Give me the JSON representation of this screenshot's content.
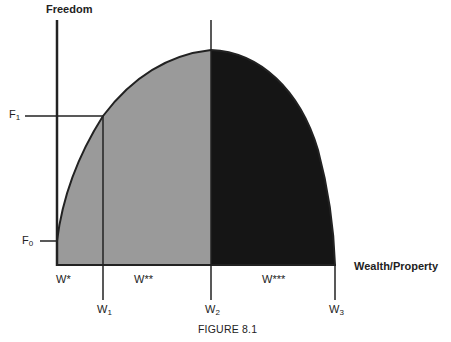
{
  "axes": {
    "y_label": "Freedom",
    "x_label": "Wealth/Property"
  },
  "y_ticks": [
    {
      "base": "F",
      "sub": "1"
    },
    {
      "base": "F",
      "sub": "0"
    }
  ],
  "x_markers": [
    {
      "base": "W",
      "sub": "1"
    },
    {
      "base": "W",
      "sub": "2"
    },
    {
      "base": "W",
      "sub": "3"
    }
  ],
  "regions": [
    {
      "label": "W*"
    },
    {
      "label": "W**"
    },
    {
      "label": "W***"
    }
  ],
  "caption": "FIGURE 8.1",
  "colors": {
    "light_region": "#9a9a9a",
    "dark_region": "#151515",
    "lines": "#222222"
  }
}
